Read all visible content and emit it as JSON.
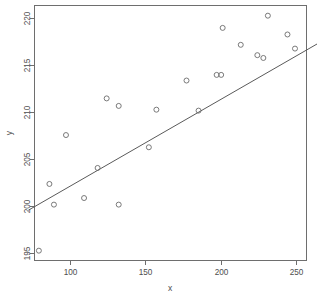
{
  "chart_data": {
    "type": "scatter",
    "title": "",
    "subtitle": "",
    "xlabel": "x",
    "ylabel": "y",
    "xlim": [
      72,
      306
    ],
    "ylim": [
      194.0,
      221.2
    ],
    "xticks": [
      100,
      150,
      200,
      250
    ],
    "yticks": [
      195,
      200,
      205,
      210,
      215,
      220
    ],
    "xtick_labels": [
      "100",
      "150",
      "200",
      "250"
    ],
    "ytick_labels": [
      "195",
      "200",
      "205",
      "210",
      "215",
      "220"
    ],
    "grid": false,
    "legend": null,
    "legend_position": "none",
    "point_marker": "open-circle",
    "point_color": "#6b6b6b",
    "line_color": "#5a5a5a",
    "axis_color": "#6e6e6e",
    "background_color": "#ffffff",
    "panel_border": true,
    "x": [
      79,
      86,
      89,
      97,
      109,
      118,
      124,
      132,
      132,
      152,
      157,
      177,
      185,
      197,
      200,
      201,
      213,
      224,
      228,
      231,
      244,
      249
    ],
    "y": [
      195.3,
      202.4,
      200.2,
      207.6,
      200.9,
      204.1,
      211.5,
      210.7,
      200.2,
      206.3,
      210.3,
      213.4,
      210.2,
      214.0,
      214.0,
      219.0,
      217.2,
      216.1,
      215.8,
      220.3,
      218.3,
      216.8
    ],
    "points": [
      {
        "x": 79,
        "y": 195.3
      },
      {
        "x": 86,
        "y": 202.4
      },
      {
        "x": 89,
        "y": 200.2
      },
      {
        "x": 97,
        "y": 207.6
      },
      {
        "x": 109,
        "y": 200.9
      },
      {
        "x": 118,
        "y": 204.1
      },
      {
        "x": 124,
        "y": 211.5
      },
      {
        "x": 132,
        "y": 210.7
      },
      {
        "x": 132,
        "y": 200.2
      },
      {
        "x": 152,
        "y": 206.3
      },
      {
        "x": 157,
        "y": 210.3
      },
      {
        "x": 177,
        "y": 213.4
      },
      {
        "x": 185,
        "y": 210.2
      },
      {
        "x": 197,
        "y": 214.0
      },
      {
        "x": 200,
        "y": 214.0
      },
      {
        "x": 201,
        "y": 219.0
      },
      {
        "x": 213,
        "y": 217.2
      },
      {
        "x": 224,
        "y": 216.1
      },
      {
        "x": 228,
        "y": 215.8
      },
      {
        "x": 231,
        "y": 220.3
      },
      {
        "x": 244,
        "y": 218.3
      },
      {
        "x": 249,
        "y": 216.8
      }
    ],
    "series": [
      {
        "name": "observations",
        "type": "scatter",
        "values": [
          195.3,
          202.4,
          200.2,
          207.6,
          200.9,
          204.1,
          211.5,
          210.7,
          200.2,
          206.3,
          210.3,
          213.4,
          210.2,
          214.0,
          214.0,
          219.0,
          217.2,
          216.1,
          215.8,
          220.3,
          218.3,
          216.8
        ]
      },
      {
        "name": "fitted-line",
        "type": "line",
        "endpoints": [
          {
            "x": 72,
            "y": 199.6
          },
          {
            "x": 306,
            "y": 221.2
          }
        ]
      }
    ],
    "fit_line": {
      "x_start": 72,
      "y_start": 199.6,
      "x_end": 306,
      "y_end": 221.2
    },
    "n_points": 22
  }
}
